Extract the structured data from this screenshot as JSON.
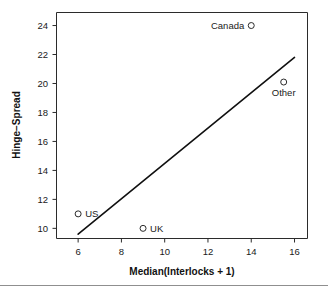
{
  "chart_data": {
    "type": "scatter",
    "title": "",
    "xlabel": "Median(Interlocks + 1)",
    "ylabel": "Hinge−Spread",
    "xlim": [
      5.0,
      16.6
    ],
    "ylim": [
      9.3,
      24.9
    ],
    "xticks": [
      6,
      8,
      10,
      12,
      14,
      16
    ],
    "xticklabels": [
      "6",
      "8",
      "10",
      "12",
      "14",
      "16"
    ],
    "yticks": [
      10,
      12,
      14,
      16,
      18,
      20,
      22,
      24
    ],
    "yticklabels": [
      "10",
      "12",
      "14",
      "16",
      "18",
      "20",
      "22",
      "24"
    ],
    "grid": false,
    "legend": false,
    "points": [
      {
        "label": "US",
        "x": 6.0,
        "y": 11.0,
        "label_position": "right"
      },
      {
        "label": "UK",
        "x": 9.0,
        "y": 10.0,
        "label_position": "right"
      },
      {
        "label": "Canada",
        "x": 14.0,
        "y": 24.0,
        "label_position": "left"
      },
      {
        "label": "Other",
        "x": 15.5,
        "y": 20.1,
        "label_position": "below"
      }
    ],
    "series": [
      {
        "name": "fitted-line",
        "type": "line",
        "x": [
          6.0,
          16.0
        ],
        "y": [
          9.6,
          21.8
        ]
      }
    ],
    "annotations": []
  },
  "figure": {
    "marker_radius": 3,
    "point_colors": "#2b2b2b",
    "line_color": "#101010",
    "axis_color": "#2b2b2b",
    "background": "#ffffff"
  }
}
